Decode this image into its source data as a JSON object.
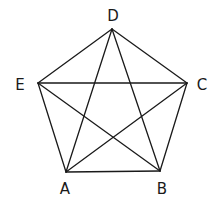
{
  "figure": {
    "type": "complete-graph-K5"
  },
  "vertices": [
    {
      "id": "A",
      "label": "A",
      "x": 66,
      "y": 172,
      "label_x": 65,
      "label_y": 189
    },
    {
      "id": "B",
      "label": "B",
      "x": 160,
      "y": 171,
      "label_x": 162,
      "label_y": 189
    },
    {
      "id": "C",
      "label": "C",
      "x": 187,
      "y": 83,
      "label_x": 202,
      "label_y": 85
    },
    {
      "id": "D",
      "label": "D",
      "x": 112,
      "y": 29,
      "label_x": 113,
      "label_y": 16
    },
    {
      "id": "E",
      "label": "E",
      "x": 38,
      "y": 83,
      "label_x": 20,
      "label_y": 85
    }
  ],
  "edges": [
    {
      "from": "A",
      "to": "B",
      "kind": "side"
    },
    {
      "from": "B",
      "to": "C",
      "kind": "side"
    },
    {
      "from": "C",
      "to": "D",
      "kind": "side"
    },
    {
      "from": "D",
      "to": "E",
      "kind": "side"
    },
    {
      "from": "E",
      "to": "A",
      "kind": "side"
    },
    {
      "from": "A",
      "to": "C",
      "kind": "diagonal"
    },
    {
      "from": "A",
      "to": "D",
      "kind": "diagonal"
    },
    {
      "from": "B",
      "to": "D",
      "kind": "diagonal"
    },
    {
      "from": "B",
      "to": "E",
      "kind": "diagonal"
    },
    {
      "from": "C",
      "to": "E",
      "kind": "diagonal"
    }
  ],
  "colors": {
    "stroke": "#1a1a1a",
    "background": "#ffffff"
  }
}
